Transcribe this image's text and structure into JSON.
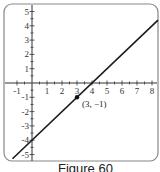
{
  "chart_data": {
    "type": "line",
    "title": "",
    "xlabel": "",
    "ylabel": "",
    "xlim": [
      -1.3,
      8.4
    ],
    "ylim": [
      -5.5,
      5.5
    ],
    "x_ticks": [
      -1,
      1,
      2,
      3,
      4,
      5,
      6,
      7,
      8
    ],
    "y_ticks": [
      5,
      4,
      3,
      2,
      1,
      -1,
      -2,
      -3,
      -4,
      -5
    ],
    "grid": false,
    "series": [
      {
        "name": "line",
        "equation": "y = x - 4",
        "x": [
          -1.3,
          8.4
        ],
        "y": [
          -5.3,
          4.4
        ],
        "color": "#1a1a1a"
      }
    ],
    "points": [
      {
        "x": 3,
        "y": -1,
        "label": "(3, −1)"
      }
    ],
    "annotations": [
      "(3, −1)"
    ]
  },
  "caption": "Figure 60",
  "colors": {
    "frame": "#888888",
    "axis": "#333333",
    "line": "#1a1a1a"
  }
}
